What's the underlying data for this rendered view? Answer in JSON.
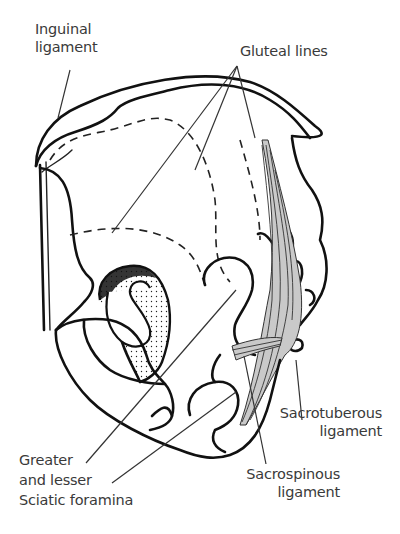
{
  "figure": {
    "labels": {
      "inguinal_ligament": [
        "Inguinal",
        "ligament"
      ],
      "gluteal_lines": [
        "Gluteal lines"
      ],
      "sciatic_foramina": [
        "Greater",
        "and lesser",
        "Sciatic foramina"
      ],
      "sacrotuberous_ligament": [
        "Sacrotuberous",
        "ligament"
      ],
      "sacrospinous_ligament": [
        "Sacrospinous",
        "ligament"
      ]
    }
  }
}
